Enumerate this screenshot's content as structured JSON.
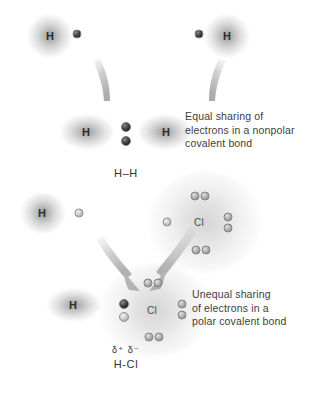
{
  "figure": {
    "background_color": "#ffffff",
    "electron_dark_color": "#2f2f2f",
    "electron_light_color": "#c2c2c2"
  },
  "panels": [
    {
      "id": "nonpolar",
      "caption": "Equal sharing of\nelectrons in a nonpolar\ncovalent bond",
      "formula": "H–H",
      "delta_labels": "",
      "reactants": [
        {
          "symbol": "H",
          "electrons": 1,
          "electron_shade": "dark"
        },
        {
          "symbol": "H",
          "electrons": 1,
          "electron_shade": "dark"
        }
      ],
      "product": {
        "symbols": [
          "H",
          "H"
        ],
        "shared_pair": 2,
        "shared_pair_shade": "dark",
        "shared_pair_position": "centered"
      }
    },
    {
      "id": "polar",
      "caption": "Unequal sharing\nof electrons in a\npolar covalent bond",
      "formula": "H-Cl",
      "delta_labels": "δ⁺ δ⁻",
      "reactants": [
        {
          "symbol": "H",
          "electrons": 1,
          "electron_shade": "light"
        },
        {
          "symbol": "Cl",
          "electrons": 7,
          "electron_shade": "mid",
          "lone_pairs": 3,
          "unpaired": 1
        }
      ],
      "product": {
        "symbols": [
          "H",
          "Cl"
        ],
        "shared_pair": 2,
        "shared_pair_shade": "mixed",
        "shared_pair_position": "shifted-toward-Cl",
        "lone_pairs": 3
      }
    }
  ],
  "atom_labels": {
    "hydrogen": "H",
    "chlorine": "Cl"
  }
}
